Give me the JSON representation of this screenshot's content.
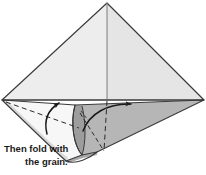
{
  "figure": {
    "kind": "paper-folding-instruction-diagram",
    "caption": {
      "line1": "Then fold with",
      "line2": "the grain."
    },
    "colors": {
      "background": "#ffffff",
      "paper_light": "#ececec",
      "paper_light_right": "#e4e4e4",
      "paper_white": "#f6f6f6",
      "paper_mid": "#cfcfcf",
      "paper_dark": "#b4b4b4",
      "paper_darker": "#9f9f9f",
      "outline": "#3a3a3a",
      "arrow": "#1a1a1a",
      "fold_dash": "#2b2b2b",
      "text": "#1a1a1a"
    },
    "geometry": {
      "apex": [
        107,
        3
      ],
      "left_corner": [
        2,
        100
      ],
      "right_corner": [
        204,
        100
      ],
      "center_line_bottom": [
        107,
        100
      ],
      "roll_bottom": [
        97,
        161
      ],
      "dark_flap_tip": [
        97,
        152
      ]
    },
    "parts": {
      "main_triangle": "large light-gray triangular sheet",
      "center_crease": "vertical crease from apex to baseline",
      "baseline": "horizontal edge across the middle",
      "left_roll": "white curled cylindrical roll on the lower left",
      "right_flap": "darker gray folded flap on the lower right",
      "dashed_fold_left": "diagonal dashed fold line on the left roll",
      "dashed_fold_center": "vertical dashed fold line at center",
      "dashed_fold_diag": "short diagonal dashed fold line on the dark flap"
    },
    "arrows": [
      {
        "name": "left-fold-arrow",
        "direction": "curves up and to the right",
        "from": [
          50,
          132
        ],
        "to": [
          62,
          104
        ]
      },
      {
        "name": "right-fold-arrow",
        "direction": "curves up and to the right",
        "from": [
          86,
          130
        ],
        "to": [
          136,
          106
        ]
      }
    ]
  }
}
